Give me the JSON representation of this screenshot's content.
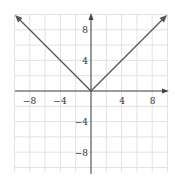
{
  "chart_data": {
    "type": "line",
    "title": "",
    "function": "y = |x|",
    "xlabel": "",
    "ylabel": "",
    "xlim": [
      -10,
      10
    ],
    "ylim": [
      -10,
      10
    ],
    "grid": true,
    "grid_step": 2,
    "x_ticks": [
      -8,
      -4,
      4,
      8
    ],
    "y_ticks": [
      8,
      4,
      -4,
      -8
    ],
    "x_tick_labels": [
      "−8",
      "−4",
      "4",
      "8"
    ],
    "y_tick_labels": [
      "8",
      "4",
      "−4",
      "−8"
    ],
    "series": [
      {
        "name": "y = |x|",
        "x": [
          -10,
          0,
          10
        ],
        "y": [
          10,
          0,
          10
        ],
        "arrows": "both-ends"
      }
    ],
    "colors": {
      "line": "#555555",
      "grid": "#e2e2e2",
      "axis": "#444444"
    }
  }
}
